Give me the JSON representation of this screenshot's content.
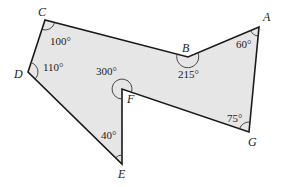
{
  "diagram": {
    "type": "polygon",
    "fill_color": "#e6e6e6",
    "stroke_color": "#1a1a1a",
    "vertices": [
      {
        "name": "A",
        "x": 259,
        "y": 27,
        "angle": "60°"
      },
      {
        "name": "B",
        "x": 188,
        "y": 57,
        "angle": "215°"
      },
      {
        "name": "C",
        "x": 45,
        "y": 20,
        "angle": "100°"
      },
      {
        "name": "D",
        "x": 28,
        "y": 72,
        "angle": "110°"
      },
      {
        "name": "E",
        "x": 122,
        "y": 164,
        "angle": "40°"
      },
      {
        "name": "F",
        "x": 122,
        "y": 89,
        "angle": "300°"
      },
      {
        "name": "G",
        "x": 249,
        "y": 132,
        "angle": "75°"
      }
    ],
    "labels": {
      "A": "A",
      "B": "B",
      "C": "C",
      "D": "D",
      "E": "E",
      "F": "F",
      "G": "G",
      "angle_A": "60°",
      "angle_B": "215°",
      "angle_C": "100°",
      "angle_D": "110°",
      "angle_E": "40°",
      "angle_F": "300°",
      "angle_G": "75°"
    }
  }
}
